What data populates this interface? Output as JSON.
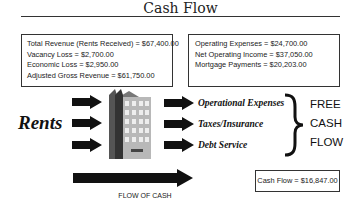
{
  "title": "Cash Flow",
  "revenue_box": {
    "lines": [
      "Total Revenue (Rents Received) = $67,400.00",
      "Vacancy Loss = $2,700.00",
      "Economic Loss = $2,950.00",
      "Adjusted Gross Revenue = $61,750.00"
    ]
  },
  "expense_box": {
    "lines": [
      "Operating Expenses = $24,700.00",
      "Net Operating Income = $37,050.00",
      "Mortgage Payments = $20,203.00"
    ]
  },
  "inflow_label": "Rents",
  "outflows": [
    "Operational Expenses",
    "Taxes/Insurance",
    "Debt Service"
  ],
  "free_cash_flow": [
    "FREE",
    "CASH",
    "FLOW"
  ],
  "flow_arrow_label": "FLOW OF CASH",
  "cash_flow_result": "Cash Flow = $16,847.00",
  "icons": {
    "building": "building-icon",
    "arrow": "arrow-right-icon",
    "brace": "right-brace-icon"
  }
}
